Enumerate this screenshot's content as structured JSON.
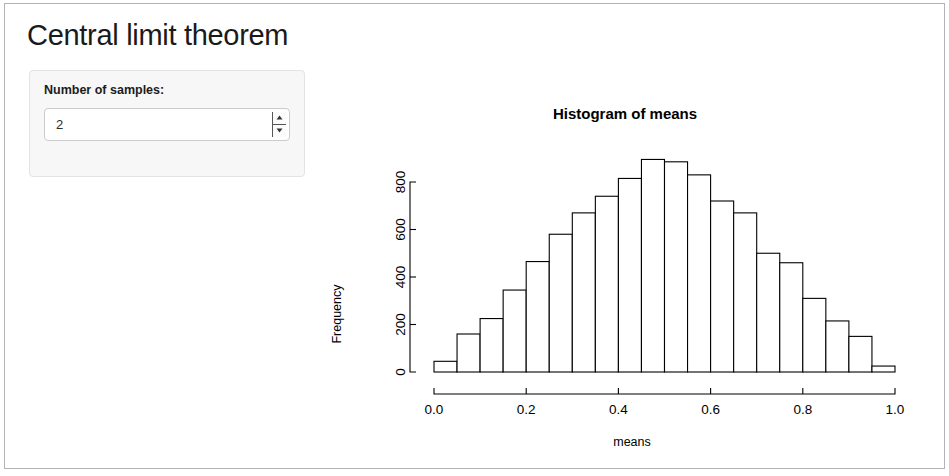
{
  "app": {
    "title": "Central limit theorem"
  },
  "sidebar": {
    "input_label": "Number of samples:",
    "numeric_input": {
      "value": "2",
      "placeholder": "",
      "spinner_up_icon": "caret-up-icon",
      "spinner_down_icon": "caret-down-icon"
    }
  },
  "chart_data": {
    "type": "bar",
    "subtype": "histogram",
    "title": "Histogram of means",
    "xlabel": "means",
    "ylabel": "Frequency",
    "xlim": [
      0.0,
      1.0
    ],
    "ylim": [
      0,
      900
    ],
    "grid": false,
    "legend": null,
    "bin_width": 0.05,
    "bin_starts": [
      0.0,
      0.05,
      0.1,
      0.15,
      0.2,
      0.25,
      0.3,
      0.35,
      0.4,
      0.45,
      0.5,
      0.55,
      0.6,
      0.65,
      0.7,
      0.75,
      0.8,
      0.85,
      0.9,
      0.95
    ],
    "categories": [
      "0.00-0.05",
      "0.05-0.10",
      "0.10-0.15",
      "0.15-0.20",
      "0.20-0.25",
      "0.25-0.30",
      "0.30-0.35",
      "0.35-0.40",
      "0.40-0.45",
      "0.45-0.50",
      "0.50-0.55",
      "0.55-0.60",
      "0.60-0.65",
      "0.65-0.70",
      "0.70-0.75",
      "0.75-0.80",
      "0.80-0.85",
      "0.85-0.90",
      "0.90-0.95",
      "0.95-1.00"
    ],
    "values": [
      45,
      160,
      225,
      345,
      465,
      580,
      670,
      740,
      815,
      895,
      885,
      830,
      720,
      670,
      500,
      460,
      310,
      215,
      150,
      25
    ],
    "xticks": [
      0.0,
      0.2,
      0.4,
      0.6,
      0.8,
      1.0
    ],
    "xtick_labels": [
      "0.0",
      "0.2",
      "0.4",
      "0.6",
      "0.8",
      "1.0"
    ],
    "yticks": [
      0,
      200,
      400,
      600,
      800
    ],
    "ytick_labels": [
      "0",
      "200",
      "400",
      "600",
      "800"
    ]
  }
}
